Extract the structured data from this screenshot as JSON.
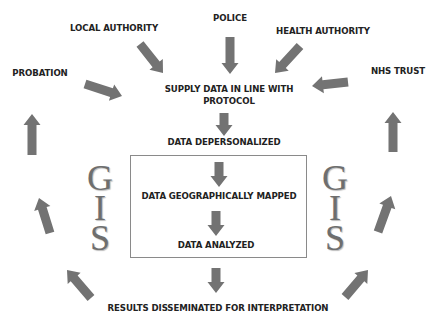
{
  "diagram": {
    "sources": [
      {
        "id": "probation",
        "label": "PROBATION"
      },
      {
        "id": "local-authority",
        "label": "LOCAL AUTHORITY"
      },
      {
        "id": "police",
        "label": "POLICE"
      },
      {
        "id": "health-authority",
        "label": "HEALTH AUTHORITY"
      },
      {
        "id": "nhs-trust",
        "label": "NHS TRUST"
      }
    ],
    "steps": {
      "supply_line1": "SUPPLY DATA IN LINE WITH",
      "supply_line2": "PROTOCOL",
      "depersonalized": "DATA DEPERSONALIZED",
      "mapped": "DATA GEOGRAPHICALLY MAPPED",
      "analyzed": "DATA ANALYZED",
      "results": "RESULTS DISSEMINATED FOR INTERPRETATION"
    },
    "gis_letters": [
      "G",
      "I",
      "S"
    ],
    "colors": {
      "arrow": "#737373",
      "text": "#222222",
      "gis": "#6e6e6e",
      "box_border": "#8a8a8a"
    }
  }
}
